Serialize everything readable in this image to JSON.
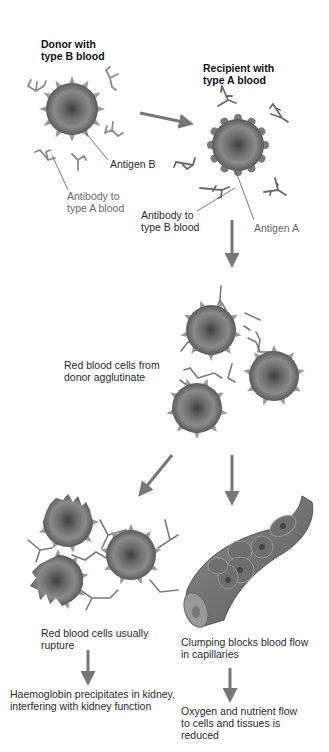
{
  "diagram": {
    "colors": {
      "cell_fill": "#7d7d7d",
      "cell_dark": "#4a4a4a",
      "antibody": "#7a7a7a",
      "arrow": "#777777",
      "text": "#2a2a2a"
    },
    "labels": {
      "donor": "Donor with\ntype B blood",
      "recipient": "Recipient with\ntype A blood",
      "antigen_b": "Antigen B",
      "antibody_a": "Antibody to\ntype A blood",
      "antibody_b": "Antibody to\ntype B blood",
      "antigen_a": "Antigen A",
      "agglutinate": "Red blood cells from\ndonor agglutinate",
      "rupture": "Red blood cells usually\nrupture",
      "clumping": "Clumping blocks blood flow\nin capillaries",
      "haemoglobin": "Haemoglobin precipitates in kidney,\ninterfering with kidney function",
      "oxygen": "Oxygen and nutrient flow\nto cells and tissues is\nreduced"
    },
    "steps": [
      {
        "id": "donor",
        "text": "Donor with type B blood"
      },
      {
        "id": "recipient",
        "text": "Recipient with type A blood"
      },
      {
        "id": "agglutinate",
        "text": "Red blood cells from donor agglutinate"
      },
      {
        "id": "rupture",
        "text": "Red blood cells usually rupture"
      },
      {
        "id": "clumping",
        "text": "Clumping blocks blood flow in capillaries"
      },
      {
        "id": "haemoglobin",
        "text": "Haemoglobin precipitates in kidney, interfering with kidney function"
      },
      {
        "id": "oxygen",
        "text": "Oxygen and nutrient flow to cells and tissues is reduced"
      }
    ]
  }
}
